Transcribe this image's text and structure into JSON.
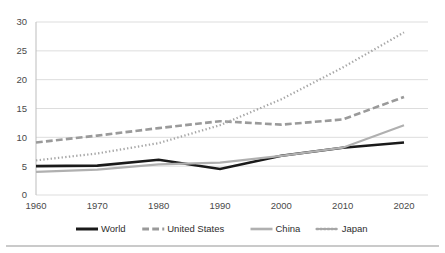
{
  "chart_data": {
    "type": "line",
    "title": "",
    "subtitle": "",
    "xlabel": "",
    "ylabel": "",
    "x": [
      1960,
      1970,
      1980,
      1990,
      2000,
      2010,
      2020
    ],
    "categories": [
      "1960",
      "1970",
      "1980",
      "1990",
      "2000",
      "2010",
      "2020"
    ],
    "xlim": [
      1960,
      2020
    ],
    "ylim": [
      0,
      30
    ],
    "yticks": [
      0,
      5,
      10,
      15,
      20,
      25,
      30
    ],
    "ytick_labels": [
      "0",
      "5",
      "10",
      "15",
      "20",
      "25",
      "30"
    ],
    "xtick_labels": [
      "1960",
      "1970",
      "1980",
      "1990",
      "2000",
      "2010",
      "2020"
    ],
    "grid": "horizontal",
    "legend_position": "bottom",
    "series": [
      {
        "name": "World",
        "values": [
          5.0,
          5.1,
          6.1,
          4.5,
          6.8,
          8.2,
          9.1
        ],
        "color": "#1a1a1a",
        "style": "solid",
        "width": 2.6
      },
      {
        "name": "United States",
        "values": [
          9.1,
          10.3,
          11.6,
          12.8,
          12.2,
          13.1,
          17.0
        ],
        "color": "#9a9a9a",
        "style": "dashed",
        "width": 2.6
      },
      {
        "name": "China",
        "values": [
          4.0,
          4.4,
          5.3,
          5.6,
          6.8,
          8.2,
          12.1
        ],
        "color": "#b0b0b0",
        "style": "solid",
        "width": 2.2
      },
      {
        "name": "Japan",
        "values": [
          6.0,
          7.2,
          9.0,
          12.1,
          16.6,
          22.1,
          28.2
        ],
        "color": "#a6a6a6",
        "style": "dotted",
        "width": 2.2
      }
    ]
  },
  "legend": {
    "items": [
      {
        "label": "World",
        "key": "world"
      },
      {
        "label": "United States",
        "key": "united-states"
      },
      {
        "label": "China",
        "key": "china"
      },
      {
        "label": "Japan",
        "key": "japan"
      }
    ]
  },
  "colors": {
    "world": "#1a1a1a",
    "united_states": "#9a9a9a",
    "china": "#b0b0b0",
    "japan": "#a6a6a6",
    "gridline": "#d9d9d9",
    "axis": "#bdbdbd",
    "text": "#4a4a4a",
    "background": "#ffffff",
    "bottom_rule": "#b9b9b9"
  }
}
